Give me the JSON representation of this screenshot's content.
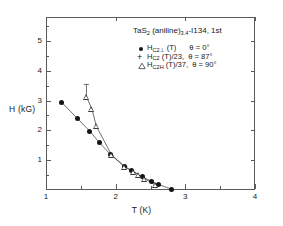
{
  "chart_data": {
    "type": "scatter",
    "title": "TaS2 (aniline)3.4-I134, 1st",
    "title_parts": {
      "compound": "TaS",
      "compound_sub": "2",
      "ligand": " (aniline)",
      "ligand_sub": "3.4",
      "sample": "-I134, 1st"
    },
    "xlabel": "T (K)",
    "ylabel": "H (kG)",
    "xlim": [
      1,
      4
    ],
    "ylim": [
      0,
      5.8
    ],
    "xscale": "linear",
    "yscale": "linear",
    "grid": false,
    "xticks": [
      1,
      2,
      3,
      4
    ],
    "xticklabels": [
      "1",
      "2",
      "3",
      "4"
    ],
    "yticks": [
      1,
      2,
      3,
      4,
      5
    ],
    "yticklabels": [
      "1",
      "2",
      "3",
      "4",
      "5"
    ],
    "legend_position": "upper-right-inside",
    "series": [
      {
        "name": "H_C2perp (T)",
        "label_base": "H",
        "label_sub": "C2⊥",
        "label_tail": " (T)",
        "angle": "θ = 0°",
        "marker": "filled-circle",
        "color": "#141414",
        "connected": true,
        "x": [
          1.22,
          1.45,
          1.63,
          1.77,
          1.93,
          2.12,
          2.23,
          2.38,
          2.52,
          2.62,
          2.8
        ],
        "y": [
          2.95,
          2.4,
          1.97,
          1.58,
          1.18,
          0.8,
          0.65,
          0.45,
          0.28,
          0.18,
          0.03
        ]
      },
      {
        "name": "H_C2 (T)/23",
        "label_base": "H",
        "label_sub": "C2",
        "label_tail": " (T)/23,",
        "angle": "θ = 87°",
        "marker": "plus",
        "color": "#141414",
        "connected": false,
        "x": [
          1.95,
          2.14,
          2.26,
          2.4,
          2.52
        ],
        "y": [
          1.17,
          0.78,
          0.58,
          0.4,
          0.25
        ]
      },
      {
        "name": "H_C2H (T)/37",
        "label_base": "H",
        "label_sub": "C2H",
        "label_tail": " (T)/37,",
        "angle": "θ = 90°",
        "marker": "open-triangle",
        "color": "#3a3a3a",
        "connected": true,
        "x": [
          1.58,
          1.66,
          1.72,
          1.94,
          2.13,
          2.26,
          2.33,
          2.41,
          2.57
        ],
        "y": [
          3.12,
          2.72,
          2.15,
          1.18,
          0.78,
          0.6,
          0.5,
          0.38,
          0.17
        ],
        "errorbar": {
          "x": 1.58,
          "y": 3.12,
          "upper": 0.42,
          "lower": 0.0
        }
      }
    ]
  }
}
